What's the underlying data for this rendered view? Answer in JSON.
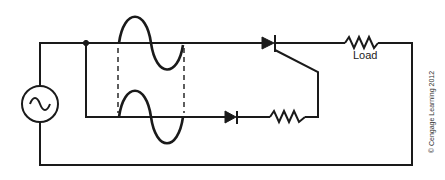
{
  "diagram": {
    "labels": {
      "load": "Load",
      "copyright": "© Cengage Learning 2012"
    },
    "components": [
      {
        "type": "ac-source",
        "symbol": "~"
      },
      {
        "type": "scr",
        "label": ""
      },
      {
        "type": "resistor",
        "label": "Load"
      },
      {
        "type": "diode",
        "label": ""
      },
      {
        "type": "resistor",
        "label": ""
      }
    ],
    "waveforms": [
      {
        "position": "top",
        "shape": "sine",
        "cycles": 1
      },
      {
        "position": "bottom",
        "shape": "sine",
        "cycles": 1
      }
    ],
    "colors": {
      "line": "#1a1a1a",
      "background": "#ffffff"
    }
  }
}
